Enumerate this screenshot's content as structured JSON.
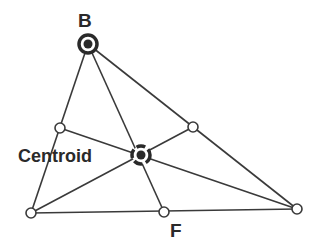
{
  "colors": {
    "stroke": "#3a3a3a",
    "background": "#ffffff",
    "label": "#2a2a2a"
  },
  "labels": {
    "vertex_b": "B",
    "centroid": "Centroid",
    "midpoint_f": "F"
  },
  "points": {
    "B": {
      "x": 88,
      "y": 44
    },
    "A": {
      "x": 31,
      "y": 213
    },
    "C": {
      "x": 297,
      "y": 209
    },
    "mid_AB": {
      "x": 60,
      "y": 128
    },
    "mid_BC": {
      "x": 193,
      "y": 127
    },
    "F": {
      "x": 164,
      "y": 212
    },
    "centroid": {
      "x": 141,
      "y": 155
    }
  }
}
